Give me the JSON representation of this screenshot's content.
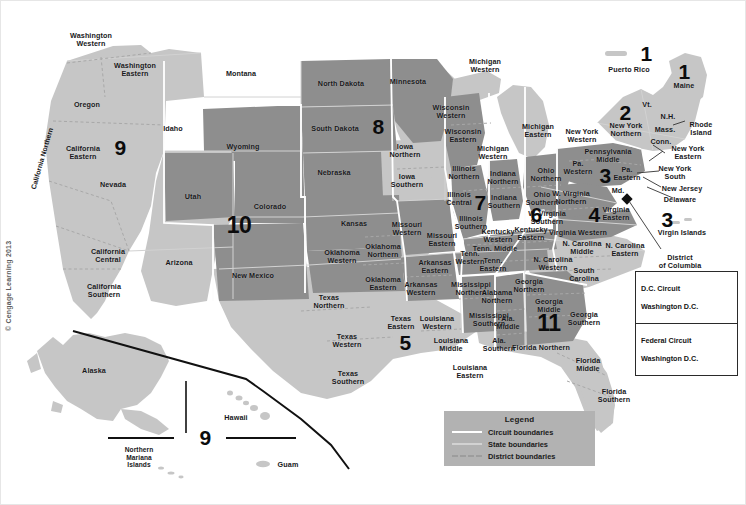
{
  "copyright": "© Cengage Learning 2013",
  "colors": {
    "light_region": "#c6c6c6",
    "dark_region": "#8e8e8e",
    "background": "#ffffff",
    "label_text": "#17181a",
    "circuit_number": "#0b0b0c",
    "legend_background": "#b2b2b2",
    "circuit_boundary": "#ffffff",
    "state_boundary": "#d2d2d2",
    "district_boundary": "#9d9d9d",
    "dc_marker": "#111111"
  },
  "legend": {
    "title": "Legend",
    "entries": [
      {
        "label": "Circuit boundaries",
        "style": "solid-white"
      },
      {
        "label": "State boundaries",
        "style": "solid-gray"
      },
      {
        "label": "District boundaries",
        "style": "dashed-gray"
      }
    ]
  },
  "circuit_boxes": [
    {
      "name": "D.C. Circuit",
      "location": "Washington D.C."
    },
    {
      "name": "Federal Circuit",
      "location": "Washington D.C."
    }
  ],
  "circuit_numbers": [
    {
      "value": "1",
      "region": "Puerto Rico",
      "x": 645,
      "y": 52
    },
    {
      "value": "1",
      "region": "Maine",
      "x": 683,
      "y": 70
    },
    {
      "value": "2",
      "region": "New York Northern",
      "x": 624,
      "y": 111
    },
    {
      "value": "3",
      "region": "Pennsylvania",
      "x": 604,
      "y": 174
    },
    {
      "value": "3",
      "region": "Virgin Islands",
      "x": 666,
      "y": 218
    },
    {
      "value": "4",
      "region": "Virginia",
      "x": 593,
      "y": 213
    },
    {
      "value": "5",
      "region": "Texas Eastern",
      "x": 404,
      "y": 341
    },
    {
      "value": "6",
      "region": "Kentucky Tennessee",
      "x": 535,
      "y": 213
    },
    {
      "value": "7",
      "region": "Indiana Illinois",
      "x": 479,
      "y": 201
    },
    {
      "value": "8",
      "region": "Dakotas",
      "x": 377,
      "y": 125
    },
    {
      "value": "9",
      "region": "West",
      "x": 119,
      "y": 146
    },
    {
      "value": "9",
      "region": "Pacific Territories",
      "x": 204,
      "y": 436
    },
    {
      "value": "10",
      "region": "Mountain",
      "x": 238,
      "y": 224
    },
    {
      "value": "11",
      "region": "Southeast",
      "x": 548,
      "y": 322
    }
  ],
  "district_labels": [
    {
      "text": "Washington\nWestern",
      "x": 90,
      "y": 39
    },
    {
      "text": "Washington\nEastern",
      "x": 134,
      "y": 69
    },
    {
      "text": "Oregon",
      "x": 86,
      "y": 104
    },
    {
      "text": "Idaho",
      "x": 172,
      "y": 128
    },
    {
      "text": "Montana",
      "x": 240,
      "y": 73
    },
    {
      "text": "Wyoming",
      "x": 242,
      "y": 146
    },
    {
      "text": "North Dakota",
      "x": 340,
      "y": 83
    },
    {
      "text": "South Dakota",
      "x": 334,
      "y": 128
    },
    {
      "text": "Minnesota",
      "x": 407,
      "y": 81
    },
    {
      "text": "Nebraska",
      "x": 333,
      "y": 172
    },
    {
      "text": "Nevada",
      "x": 112,
      "y": 184
    },
    {
      "text": "Utah",
      "x": 192,
      "y": 196
    },
    {
      "text": "Colorado",
      "x": 269,
      "y": 206
    },
    {
      "text": "Kansas",
      "x": 353,
      "y": 223
    },
    {
      "text": "Arizona",
      "x": 178,
      "y": 262
    },
    {
      "text": "New Mexico",
      "x": 252,
      "y": 275
    },
    {
      "text": "California\nEastern",
      "x": 82,
      "y": 152
    },
    {
      "text": "California\nCentral",
      "x": 107,
      "y": 255
    },
    {
      "text": "California\nSouthern",
      "x": 103,
      "y": 290
    },
    {
      "text": "California Northern",
      "x": 47,
      "y": 160,
      "rotated": true
    },
    {
      "text": "Iowa\nNorthern",
      "x": 404,
      "y": 150
    },
    {
      "text": "Iowa\nSouthern",
      "x": 406,
      "y": 180
    },
    {
      "text": "Wisconsin\nWestern",
      "x": 450,
      "y": 111
    },
    {
      "text": "Wisconsin\nEastern",
      "x": 462,
      "y": 135
    },
    {
      "text": "Michigan\nWestern",
      "x": 484,
      "y": 65
    },
    {
      "text": "Michigan\nEastern",
      "x": 537,
      "y": 130
    },
    {
      "text": "Michigan\nWestern",
      "x": 492,
      "y": 152
    },
    {
      "text": "Illinois\nNorthern",
      "x": 463,
      "y": 172
    },
    {
      "text": "Illinois\nCentral",
      "x": 458,
      "y": 198
    },
    {
      "text": "Illinois\nSouthern",
      "x": 470,
      "y": 222
    },
    {
      "text": "Indiana\nNorthern",
      "x": 502,
      "y": 177
    },
    {
      "text": "Indiana\nSouthern",
      "x": 503,
      "y": 201
    },
    {
      "text": "Ohio\nNorthern",
      "x": 545,
      "y": 174
    },
    {
      "text": "Ohio\nSouthern",
      "x": 541,
      "y": 198
    },
    {
      "text": "Missouri\nWestern",
      "x": 406,
      "y": 228
    },
    {
      "text": "Missouri\nEastern",
      "x": 441,
      "y": 239
    },
    {
      "text": "Oklahoma\nNorthern",
      "x": 382,
      "y": 250
    },
    {
      "text": "Oklahoma\nWestern",
      "x": 341,
      "y": 256
    },
    {
      "text": "Oklahoma\nEastern",
      "x": 382,
      "y": 283
    },
    {
      "text": "Arkansas\nEastern",
      "x": 434,
      "y": 266
    },
    {
      "text": "Arkansas\nWestern",
      "x": 420,
      "y": 288
    },
    {
      "text": "Texas\nNorthern",
      "x": 328,
      "y": 301
    },
    {
      "text": "Texas\nWestern",
      "x": 346,
      "y": 340
    },
    {
      "text": "Texas\nSouthern",
      "x": 347,
      "y": 377
    },
    {
      "text": "Texas\nEastern",
      "x": 400,
      "y": 322
    },
    {
      "text": "Louisiana\nWestern",
      "x": 436,
      "y": 322
    },
    {
      "text": "Louisiana\nMiddle",
      "x": 450,
      "y": 344
    },
    {
      "text": "Louisiana\nEastern",
      "x": 469,
      "y": 371
    },
    {
      "text": "Mississippi\nNorthern",
      "x": 470,
      "y": 288
    },
    {
      "text": "Mississippi\nSouthern",
      "x": 488,
      "y": 319
    },
    {
      "text": "Tenn.\nWestern",
      "x": 469,
      "y": 257
    },
    {
      "text": "Tenn. Middle",
      "x": 494,
      "y": 248
    },
    {
      "text": "Tenn.\nEastern",
      "x": 492,
      "y": 264
    },
    {
      "text": "Kentucky\nWestern",
      "x": 497,
      "y": 235
    },
    {
      "text": "Kentucky\nEastern",
      "x": 530,
      "y": 233
    },
    {
      "text": "W. Virginia\nNorthern",
      "x": 570,
      "y": 197
    },
    {
      "text": "W. Virginia\nSouthern",
      "x": 546,
      "y": 217
    },
    {
      "text": "Virginia Western",
      "x": 577,
      "y": 232
    },
    {
      "text": "Virginia\nEastern",
      "x": 615,
      "y": 213
    },
    {
      "text": "Pennsylvania\nMiddle",
      "x": 607,
      "y": 155
    },
    {
      "text": "Pa.\nWestern",
      "x": 577,
      "y": 167
    },
    {
      "text": "Pa.\nEastern",
      "x": 626,
      "y": 173
    },
    {
      "text": "New York\nWestern",
      "x": 581,
      "y": 135
    },
    {
      "text": "New York\nNorthern",
      "x": 625,
      "y": 129
    },
    {
      "text": "New York\nEastern",
      "x": 687,
      "y": 152
    },
    {
      "text": "New York\nSouth",
      "x": 674,
      "y": 172
    },
    {
      "text": "New Jersey",
      "x": 681,
      "y": 188
    },
    {
      "text": "Delaware",
      "x": 679,
      "y": 199
    },
    {
      "text": "Md.",
      "x": 617,
      "y": 190
    },
    {
      "text": "Vt.",
      "x": 646,
      "y": 104
    },
    {
      "text": "N.H.",
      "x": 667,
      "y": 116
    },
    {
      "text": "Mass.",
      "x": 664,
      "y": 129
    },
    {
      "text": "Conn.",
      "x": 660,
      "y": 141
    },
    {
      "text": "Rhode\nIsland",
      "x": 700,
      "y": 128
    },
    {
      "text": "Maine",
      "x": 683,
      "y": 85
    },
    {
      "text": "Puerto Rico",
      "x": 628,
      "y": 69
    },
    {
      "text": "Virgin Islands",
      "x": 681,
      "y": 232
    },
    {
      "text": "District\nof Columbia",
      "x": 679,
      "y": 261
    },
    {
      "text": "N. Carolina\nMiddle",
      "x": 581,
      "y": 247
    },
    {
      "text": "N. Carolina\nEastern",
      "x": 624,
      "y": 249
    },
    {
      "text": "N. Carolina\nWestern",
      "x": 552,
      "y": 263
    },
    {
      "text": "South\nCarolina",
      "x": 583,
      "y": 274
    },
    {
      "text": "Georgia\nNorthern",
      "x": 528,
      "y": 285
    },
    {
      "text": "Georgia\nMiddle",
      "x": 548,
      "y": 305
    },
    {
      "text": "Georgia\nSouthern",
      "x": 583,
      "y": 318
    },
    {
      "text": "Alabama\nNorthern",
      "x": 496,
      "y": 296
    },
    {
      "text": "Ala.\nMiddle",
      "x": 507,
      "y": 322
    },
    {
      "text": "Ala.\nSouthern",
      "x": 498,
      "y": 344
    },
    {
      "text": "Florida Northern",
      "x": 540,
      "y": 347
    },
    {
      "text": "Florida\nMiddle",
      "x": 587,
      "y": 364
    },
    {
      "text": "Florida\nSouthern",
      "x": 613,
      "y": 395
    },
    {
      "text": "Alaska",
      "x": 93,
      "y": 370
    },
    {
      "text": "Hawaii",
      "x": 235,
      "y": 417
    },
    {
      "text": "Northern\nMariana\nIslands",
      "x": 138,
      "y": 456
    },
    {
      "text": "Guam",
      "x": 287,
      "y": 464
    }
  ]
}
